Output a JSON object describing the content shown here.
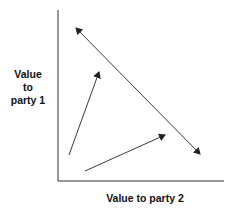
{
  "diagram": {
    "y_axis_label": [
      "Value",
      "to",
      "party 1"
    ],
    "x_axis_label": "Value to party 2",
    "colors": {
      "axis": "#333333",
      "arrow": "#222222"
    },
    "arrows": [
      {
        "name": "tradeoff-frontier",
        "type": "double-headed",
        "from": [
          75,
          27
        ],
        "to": [
          201,
          155
        ]
      },
      {
        "name": "party1-gain",
        "type": "single-headed",
        "from": [
          69,
          155
        ],
        "to": [
          99,
          72
        ]
      },
      {
        "name": "party2-gain",
        "type": "single-headed",
        "from": [
          85,
          171
        ],
        "to": [
          165,
          135
        ]
      }
    ]
  }
}
